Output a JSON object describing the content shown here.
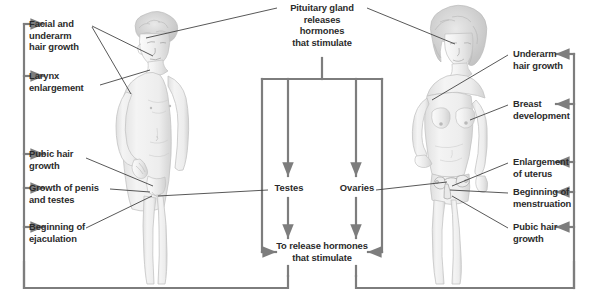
{
  "diagram": {
    "line_color": "#7d7d7d",
    "leader_color": "#3a3a3a",
    "text_color": "#2b2b2b",
    "background": "#ffffff"
  },
  "center": {
    "top_text": "Pituitary gland\nreleases\nhormones\nthat stimulate",
    "male_gonad": "Testes",
    "female_gonad": "Ovaries",
    "bottom_text": "To release hormones\nthat stimulate"
  },
  "male": {
    "figure_name": "male-figure-illustration",
    "labels": [
      {
        "id": "facial-underarm-hair",
        "text": "Facial and\nunderarm\nhair growth"
      },
      {
        "id": "larynx-enlargement",
        "text": "Larynx\nenlargement"
      },
      {
        "id": "pubic-hair-growth",
        "text": "Pubic hair\ngrowth"
      },
      {
        "id": "growth-of-penis-and-testes",
        "text": "Growth of penis\nand testes"
      },
      {
        "id": "beginning-of-ejaculation",
        "text": "Beginning of\nejaculation"
      }
    ]
  },
  "female": {
    "figure_name": "female-figure-illustration",
    "labels": [
      {
        "id": "underarm-hair-growth",
        "text": "Underarm\nhair growth"
      },
      {
        "id": "breast-development",
        "text": "Breast\ndevelopment"
      },
      {
        "id": "enlargement-of-uterus",
        "text": "Enlargement\nof uterus"
      },
      {
        "id": "beginning-of-menstruation",
        "text": "Beginning of\nmenstruation"
      },
      {
        "id": "pubic-hair-growth-female",
        "text": "Pubic hair\ngrowth"
      }
    ]
  }
}
